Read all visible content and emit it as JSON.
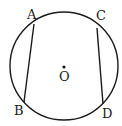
{
  "diagram": {
    "type": "circle-with-chords",
    "stroke_color": "#1a1a1a",
    "background": "#ffffff",
    "circle": {
      "cx": 64,
      "cy": 66,
      "r": 54
    },
    "center": {
      "label": "O",
      "x": 64,
      "y": 67
    },
    "points": {
      "A": {
        "label": "A",
        "x": 34,
        "y": 24
      },
      "B": {
        "label": "B",
        "x": 24,
        "y": 102
      },
      "C": {
        "label": "C",
        "x": 97,
        "y": 28
      },
      "D": {
        "label": "D",
        "x": 103,
        "y": 104
      }
    },
    "chords": [
      {
        "from": "A",
        "to": "B"
      },
      {
        "from": "C",
        "to": "D"
      }
    ]
  }
}
